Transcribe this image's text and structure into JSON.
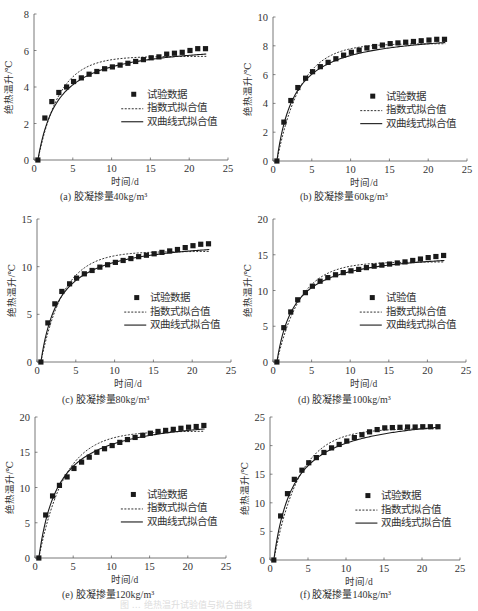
{
  "figure_caption": "图 … 绝热温升试验值与拟合曲线",
  "chart_data": [
    {
      "id": "a",
      "type": "scatter",
      "subtitle": "(a) 胶凝掺量40kg/m³",
      "xlabel": "时间/d",
      "ylabel": "绝热温升/℃",
      "xlim": [
        0,
        25
      ],
      "ylim": [
        0,
        8
      ],
      "xticks": [
        0,
        5,
        10,
        15,
        20,
        25
      ],
      "yticks": [
        0,
        2,
        4,
        6,
        8
      ],
      "legend": [
        "试验数据",
        "指数式拟合值",
        "双曲线式拟合值"
      ],
      "legend_position": "center-right",
      "grid": false,
      "series": [
        {
          "name": "试验数据",
          "kind": "markers",
          "x": [
            0.5,
            1.4,
            2.3,
            3.2,
            4.2,
            5.1,
            6.1,
            7.1,
            8.1,
            9.1,
            10.1,
            11.1,
            12.1,
            13.1,
            14.1,
            15.1,
            16.1,
            17.1,
            18.1,
            19.1,
            20.1,
            21.1,
            22.1
          ],
          "y": [
            0,
            2.3,
            3.2,
            3.7,
            4.0,
            4.3,
            4.5,
            4.7,
            4.85,
            5.0,
            5.1,
            5.2,
            5.3,
            5.4,
            5.5,
            5.6,
            5.65,
            5.8,
            5.85,
            5.9,
            6.0,
            6.1,
            6.1
          ]
        },
        {
          "name": "指数式拟合值",
          "kind": "exp",
          "Tmax": 5.68,
          "k": 0.36,
          "t0": 0.5,
          "tend": 22.2
        },
        {
          "name": "双曲线式拟合值",
          "kind": "hyp",
          "Tmax": 6.5,
          "n": 2.6,
          "t0": 0.5,
          "tend": 22.2
        }
      ],
      "box": {
        "x0": 34,
        "x25": 228,
        "y0": 160,
        "ytop": 14
      }
    },
    {
      "id": "b",
      "type": "scatter",
      "subtitle": "(b) 胶凝掺量60kg/m³",
      "xlabel": "时间/d",
      "ylabel": "绝热温升/℃",
      "xlim": [
        0,
        25
      ],
      "ylim": [
        0,
        10
      ],
      "xticks": [
        0,
        5,
        10,
        15,
        20,
        25
      ],
      "yticks": [
        0,
        2,
        4,
        6,
        8,
        10
      ],
      "legend": [
        "试验数据",
        "指数式拟合值",
        "双曲线式拟合值"
      ],
      "legend_position": "center-right",
      "grid": false,
      "series": [
        {
          "name": "试验数据",
          "kind": "markers",
          "x": [
            0.5,
            1.4,
            2.3,
            3.2,
            4.2,
            5.1,
            6.1,
            7.1,
            8.1,
            9.1,
            10.1,
            11.1,
            12.1,
            13.1,
            14.1,
            15.1,
            16.1,
            17.1,
            18.1,
            19.1,
            20.1,
            21.1,
            22.1
          ],
          "y": [
            0,
            2.7,
            4.2,
            5.1,
            5.75,
            6.2,
            6.55,
            6.85,
            7.1,
            7.35,
            7.55,
            7.7,
            7.85,
            7.95,
            8.05,
            8.15,
            8.2,
            8.25,
            8.3,
            8.35,
            8.4,
            8.45,
            8.45
          ]
        },
        {
          "name": "指数式拟合值",
          "kind": "exp",
          "Tmax": 8.15,
          "k": 0.33,
          "t0": 0.5,
          "tend": 22.2
        },
        {
          "name": "双曲线式拟合值",
          "kind": "hyp",
          "Tmax": 9.1,
          "n": 2.3,
          "t0": 0.5,
          "tend": 22.2
        }
      ],
      "box": {
        "x0": 273,
        "x25": 467,
        "y0": 161,
        "ytop": 17
      }
    },
    {
      "id": "c",
      "type": "scatter",
      "subtitle": "(c) 胶凝掺量80kg/m³",
      "xlabel": "时间/d",
      "ylabel": "绝热温升/℃",
      "xlim": [
        0,
        25
      ],
      "ylim": [
        0,
        15
      ],
      "xticks": [
        0,
        5,
        10,
        15,
        20,
        25
      ],
      "yticks": [
        0,
        5,
        10,
        15
      ],
      "legend": [
        "试验数据",
        "指数式拟合值",
        "双曲线式拟合值"
      ],
      "legend_position": "center-right",
      "grid": false,
      "series": [
        {
          "name": "试验数据",
          "kind": "markers",
          "x": [
            0.5,
            1.4,
            2.3,
            3.2,
            4.2,
            5.1,
            6.1,
            7.1,
            8.1,
            9.1,
            10.1,
            11.1,
            12.1,
            13.1,
            14.1,
            15.1,
            16.1,
            17.1,
            18.1,
            19.1,
            20.1,
            21.1,
            22.1
          ],
          "y": [
            0,
            4.1,
            6.1,
            7.4,
            8.2,
            8.8,
            9.25,
            9.6,
            9.95,
            10.2,
            10.45,
            10.65,
            10.85,
            11.05,
            11.2,
            11.35,
            11.5,
            11.65,
            11.8,
            12.0,
            12.2,
            12.35,
            12.4
          ]
        },
        {
          "name": "指数式拟合值",
          "kind": "exp",
          "Tmax": 11.6,
          "k": 0.34,
          "t0": 0.5,
          "tend": 22.2
        },
        {
          "name": "双曲线式拟合值",
          "kind": "hyp",
          "Tmax": 13.1,
          "n": 2.4,
          "t0": 0.5,
          "tend": 22.2
        }
      ],
      "box": {
        "x0": 37,
        "x25": 231,
        "y0": 362,
        "ytop": 219
      }
    },
    {
      "id": "d",
      "type": "scatter",
      "subtitle": "(d) 胶凝掺量100kg/m³",
      "xlabel": "时间/d",
      "ylabel": "绝热温升/℃",
      "xlim": [
        0,
        25
      ],
      "ylim": [
        0,
        20
      ],
      "xticks": [
        0,
        5,
        10,
        15,
        20,
        25
      ],
      "yticks": [
        0,
        5,
        10,
        15,
        20
      ],
      "legend": [
        "试验值",
        "指数式拟合值",
        "双曲线式拟合值"
      ],
      "legend_position": "center-right",
      "grid": false,
      "series": [
        {
          "name": "试验值",
          "kind": "markers",
          "x": [
            0.5,
            1.4,
            2.3,
            3.2,
            4.2,
            5.1,
            6.1,
            7.1,
            8.1,
            9.1,
            10.1,
            11.1,
            12.1,
            13.1,
            14.1,
            15.1,
            16.1,
            17.1,
            18.1,
            19.1,
            20.1,
            21.1,
            22.1
          ],
          "y": [
            0,
            4.8,
            7.0,
            8.7,
            9.7,
            10.6,
            11.3,
            11.8,
            12.2,
            12.5,
            12.75,
            12.95,
            13.2,
            13.4,
            13.55,
            13.7,
            13.85,
            14.0,
            14.2,
            14.4,
            14.6,
            14.75,
            14.9
          ]
        },
        {
          "name": "指数式拟合值",
          "kind": "exp",
          "Tmax": 14.0,
          "k": 0.33,
          "t0": 0.5,
          "tend": 22.2
        },
        {
          "name": "双曲线式拟合值",
          "kind": "hyp",
          "Tmax": 15.7,
          "n": 2.3,
          "t0": 0.5,
          "tend": 22.2
        }
      ],
      "box": {
        "x0": 273,
        "x25": 466,
        "y0": 362,
        "ytop": 219
      }
    },
    {
      "id": "e",
      "type": "scatter",
      "subtitle": "(e) 胶凝掺量120kg/m³",
      "xlabel": "时间/d",
      "ylabel": "绝热温升/℃",
      "xlim": [
        0,
        25
      ],
      "ylim": [
        0,
        20
      ],
      "xticks": [
        0,
        5,
        10,
        15,
        20,
        25
      ],
      "yticks": [
        0,
        5,
        10,
        15,
        20
      ],
      "legend": [
        "试验数据",
        "指数式拟合值",
        "双曲线式拟合值"
      ],
      "legend_position": "center-right",
      "grid": false,
      "series": [
        {
          "name": "试验数据",
          "kind": "markers",
          "x": [
            0.5,
            1.4,
            2.3,
            3.2,
            4.2,
            5.1,
            6.1,
            7.1,
            8.1,
            9.1,
            10.1,
            11.1,
            12.1,
            13.1,
            14.1,
            15.1,
            16.1,
            17.1,
            18.1,
            19.1,
            20.1,
            21.1,
            22.1
          ],
          "y": [
            0,
            6.1,
            8.8,
            10.3,
            11.5,
            12.7,
            13.6,
            14.3,
            15.0,
            15.5,
            15.95,
            16.4,
            16.8,
            17.1,
            17.4,
            17.7,
            17.95,
            18.1,
            18.25,
            18.4,
            18.55,
            18.65,
            18.8
          ]
        },
        {
          "name": "指数式拟合值",
          "kind": "exp",
          "Tmax": 18.0,
          "k": 0.3,
          "t0": 0.5,
          "tend": 22.2
        },
        {
          "name": "双曲线式拟合值",
          "kind": "hyp",
          "Tmax": 20.5,
          "n": 2.6,
          "t0": 0.5,
          "tend": 22.2
        }
      ],
      "box": {
        "x0": 35,
        "x25": 226,
        "y0": 558,
        "ytop": 417
      }
    },
    {
      "id": "f",
      "type": "scatter",
      "subtitle": "(f) 胶凝掺量140kg/m³",
      "xlabel": "时间/d",
      "ylabel": "绝热温升/℃",
      "xlim": [
        0,
        25
      ],
      "ylim": [
        0,
        25
      ],
      "xticks": [
        0,
        5,
        10,
        15,
        20,
        25
      ],
      "yticks": [
        0,
        5,
        10,
        15,
        20,
        25
      ],
      "legend": [
        "试验数据",
        "指数式拟合值",
        "双曲线式拟合值"
      ],
      "legend_position": "center-right",
      "grid": false,
      "series": [
        {
          "name": "试验数据",
          "kind": "markers",
          "x": [
            0.5,
            1.4,
            2.3,
            3.2,
            4.2,
            5.1,
            6.1,
            7.1,
            8.1,
            9.1,
            10.1,
            11.1,
            12.1,
            13.1,
            14.1,
            15.1,
            16.1,
            17.1,
            18.1,
            19.1,
            20.1,
            21.1,
            22.1
          ],
          "y": [
            0,
            7.7,
            11.6,
            14.1,
            15.7,
            17.0,
            17.9,
            18.8,
            19.6,
            20.2,
            20.8,
            21.4,
            21.9,
            22.4,
            22.8,
            23.1,
            23.15,
            23.2,
            23.25,
            23.25,
            23.3,
            23.3,
            23.3
          ]
        },
        {
          "name": "指数式拟合值",
          "kind": "exp",
          "Tmax": 23.0,
          "k": 0.3,
          "t0": 0.5,
          "tend": 22.2
        },
        {
          "name": "双曲线式拟合值",
          "kind": "hyp",
          "Tmax": 26.0,
          "n": 2.6,
          "t0": 0.5,
          "tend": 22.2
        }
      ],
      "box": {
        "x0": 270,
        "x25": 460,
        "y0": 560,
        "ytop": 417
      }
    }
  ]
}
